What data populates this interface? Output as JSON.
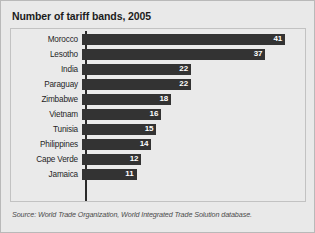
{
  "figure": {
    "title": "Number of tariff bands, 2005",
    "source_note": "Source: World Trade Organization, World Integrated Trade Solution database.",
    "colors": {
      "bar": "#333333",
      "value_label": "#ffffff",
      "background": "#e9e9e9",
      "panel_background": "#eaeaea",
      "frame_border": "#b9b9b9",
      "axis": "#2b2b2b",
      "title_text": "#1c1c1c",
      "category_text": "#1f1f1f",
      "source_text": "#4b4b4b"
    }
  },
  "chart_data": {
    "type": "bar",
    "orientation": "horizontal",
    "title": "Number of tariff bands, 2005",
    "xlabel": "",
    "ylabel": "",
    "xlim": [
      0,
      45
    ],
    "grid": false,
    "legend": null,
    "value_labels": true,
    "value_label_position": "inside-end",
    "sorted": "descending",
    "categories": [
      "Morocco",
      "Lesotho",
      "India",
      "Paraguay",
      "Zimbabwe",
      "Vietnam",
      "Tunisia",
      "Philippines",
      "Cape Verde",
      "Jamaica"
    ],
    "values": [
      41,
      37,
      22,
      22,
      18,
      16,
      15,
      14,
      12,
      11
    ],
    "annotations": [
      "Source: World Trade Organization, World Integrated Trade Solution database."
    ]
  }
}
